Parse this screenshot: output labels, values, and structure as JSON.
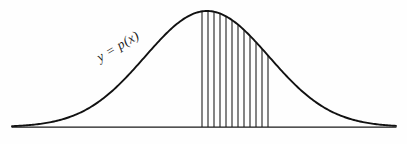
{
  "figure": {
    "background_color": "#fefefe",
    "curve_color": "#111111",
    "axis_color": "#1a1a1a",
    "hatch_color": "#3a3a3a",
    "label": {
      "text": "y = p(x)",
      "rotation_degrees": -31,
      "x": 100,
      "y": 62
    },
    "axis": {
      "x_start": 12,
      "x_end": 396,
      "y": 127
    }
  },
  "chart_data": {
    "type": "area",
    "title": "",
    "subtitle": "",
    "xlabel": "",
    "ylabel": "",
    "legend": [],
    "grid": false,
    "annotations": [
      {
        "text": "y = p(x)",
        "x": 100,
        "y": 62,
        "rotation": -31
      }
    ],
    "curve": {
      "name": "p(x)",
      "shape": "gaussian",
      "peak_x": 207,
      "peak_y": 11,
      "baseline_y": 127,
      "left_end_x": 12,
      "right_end_x": 396,
      "amplitude": 116,
      "sigma": 62
    },
    "shaded_region": {
      "label": "hatched interval",
      "x_from": 202,
      "x_to": 268,
      "hatch_count": 12,
      "hatch_spacing": 6,
      "fill": "vertical-line-hatch"
    },
    "x": [
      12,
      35,
      60,
      85,
      110,
      135,
      160,
      185,
      207,
      230,
      255,
      280,
      305,
      330,
      355,
      380,
      396
    ],
    "y": [
      0.003,
      0.012,
      0.043,
      0.122,
      0.286,
      0.539,
      0.818,
      0.977,
      1.0,
      0.937,
      0.742,
      0.487,
      0.263,
      0.117,
      0.042,
      0.012,
      0.005
    ],
    "ylim": [
      0,
      1
    ],
    "xlim": [
      12,
      396
    ]
  }
}
